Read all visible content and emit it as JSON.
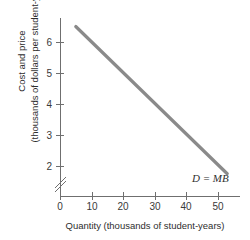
{
  "chart_data": {
    "type": "line",
    "title": "",
    "xlabel": "Quantity (thousands of student-years)",
    "ylabel_line1": "Cost and price",
    "ylabel_line2": "(thousands of dollars per student-year)",
    "xlim": [
      0,
      57
    ],
    "ylim": [
      1.5,
      6.8
    ],
    "grid": false,
    "legend_position": "inline-right",
    "xticks": [
      0,
      10,
      20,
      30,
      40,
      50
    ],
    "xticklabels": [
      "0",
      "10",
      "20",
      "30",
      "40",
      "50"
    ],
    "yticks": [
      2,
      3,
      4,
      5,
      6
    ],
    "yticklabels": [
      "2",
      "3",
      "4",
      "5",
      "6"
    ],
    "y_axis_break": true,
    "y_axis_break_between": [
      0,
      2
    ],
    "series": [
      {
        "name": "D = MB",
        "label": "D = MB",
        "color": "#8a8a8a",
        "x": [
          5,
          53
        ],
        "values": [
          6.5,
          1.75
        ]
      }
    ],
    "annotations": [
      {
        "text": "D = MB",
        "x": 47,
        "y": 2.3
      }
    ]
  }
}
